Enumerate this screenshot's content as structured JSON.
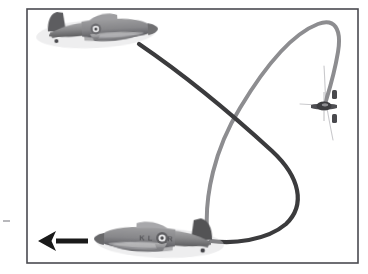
{
  "figure": {
    "kind": "aviation-maneuver-diagram",
    "background_color": "#ffffff",
    "width": 368,
    "height": 274,
    "border": {
      "color": "#4a4a50",
      "width": 1.6,
      "inset_left": 27,
      "inset_top": 9,
      "inset_right": 358,
      "inset_bottom": 263
    },
    "caption_text": "",
    "edge_mark": {
      "present": true,
      "color": "#b8b8bc",
      "x": 3,
      "y": 220,
      "width": 7,
      "height": 2
    }
  },
  "palette": {
    "dark_track": "#3a3a3c",
    "light_track": "#8d8d90",
    "hairline": "#c9c9cc",
    "arrow": "#1a1a1a",
    "aircraft_body": "#8e8e90",
    "aircraft_shadow": "#5c5c5e",
    "aircraft_dark": "#3f3f41",
    "aircraft_light": "#c0c0c2",
    "roundel": "#4a4a4c",
    "border": "#4a4a50",
    "background": "#ffffff"
  },
  "tracks": [
    {
      "name": "dark-flight-path",
      "label": "",
      "color": "#3a3a3c",
      "stroke_width": 4.2,
      "description": "Dark trace leaving the upper aircraft tail, sweeping down-right across the frame, curving into a tight U at the right and returning left to the lower aircraft tail.",
      "path": "M 139 44 C 186 76 236 118 272 151 C 300 177 306 205 286 224 C 266 241 232 244 211 241"
    },
    {
      "name": "light-flight-path",
      "label": "",
      "color": "#8d8d90",
      "stroke_width": 4.0,
      "description": "Light gray trace rising from the lower aircraft tail, arcing up over the top of the frame, then descending on the right toward the head-on aircraft.",
      "path": "M 207 230 C 205 196 214 150 240 108 C 264 68 292 34 318 24 C 334 18 342 28 338 52 C 334 76 328 94 325 104"
    }
  ],
  "hairlines": [
    {
      "name": "apex-hairline-upper",
      "color": "#c9c9cc",
      "stroke_width": 1.1,
      "path": "M 324 66 C 325 80 325 92 326 103"
    },
    {
      "name": "apex-hairline-lower",
      "color": "#c9c9cc",
      "stroke_width": 1.1,
      "path": "M 327 108 C 329 120 331 130 333 140"
    },
    {
      "name": "apex-hairline-left",
      "color": "#c9c9cc",
      "stroke_width": 1.0,
      "path": "M 300 104 L 318 105"
    }
  ],
  "aircraft": [
    {
      "name": "upper-aircraft",
      "type": "hurricane-fighter",
      "orientation": "side-view-facing-right",
      "center_x": 96,
      "center_y": 32,
      "length": 118,
      "markings": {
        "roundel": true,
        "code_letters": "",
        "fin_flash": false
      }
    },
    {
      "name": "lower-aircraft",
      "type": "hurricane-fighter",
      "orientation": "side-view-facing-left",
      "center_x": 160,
      "center_y": 241,
      "length": 126,
      "markings": {
        "roundel": true,
        "code_letters": "KL-R",
        "fin_flash": false
      }
    },
    {
      "name": "apex-aircraft",
      "type": "hurricane-fighter",
      "orientation": "head-on-view",
      "center_x": 324,
      "center_y": 106,
      "span": 26,
      "markings": {
        "roundel": false,
        "code_letters": "",
        "fin_flash": false
      }
    }
  ],
  "arrow": {
    "name": "direction-arrow",
    "label": "",
    "color": "#1a1a1a",
    "direction": "left",
    "tail_x": 88,
    "head_x": 38,
    "y": 241,
    "shaft_thickness": 5,
    "head_width": 18,
    "head_height": 20
  }
}
